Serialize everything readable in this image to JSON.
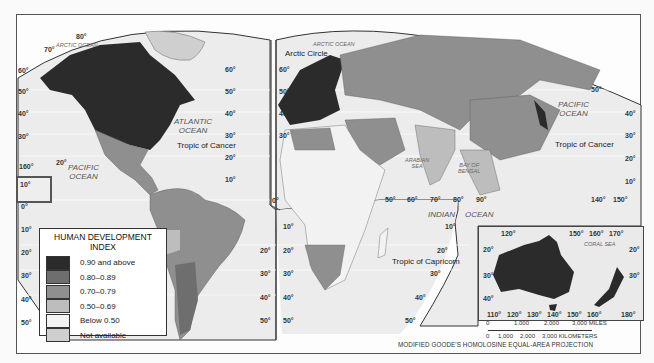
{
  "map": {
    "title": "Human Development Index World Map",
    "projection": "MODIFIED GOODE'S HOMOLOSINE EQUAL-AREA PROJECTION",
    "colors": {
      "background": "#fdfdfd",
      "ocean": "#e8e8e8",
      "hdi_090_above": "#2b2b2b",
      "hdi_080_089": "#6e6e6e",
      "hdi_070_079": "#8f8f8f",
      "hdi_050_069": "#bdbdbd",
      "hdi_below_050": "#f2f2f2",
      "not_available": "#cfcfcf"
    }
  },
  "legend": {
    "title_line1": "HUMAN DEVELOPMENT",
    "title_line2": "INDEX",
    "items": [
      {
        "label": "0.90 and above",
        "color": "#2b2b2b"
      },
      {
        "label": "0.80–0.89",
        "color": "#6e6e6e"
      },
      {
        "label": "0.70–0.79",
        "color": "#8f8f8f"
      },
      {
        "label": "0.50–0.69",
        "color": "#bdbdbd"
      },
      {
        "label": "Below 0.50",
        "color": "#f2f2f2"
      },
      {
        "label": "Not available",
        "color": "#cfcfcf"
      }
    ]
  },
  "labels": {
    "arctic_ocean_west": "ARCTIC OCEAN",
    "arctic_ocean_east": "ARCTIC OCEAN",
    "arctic_circle": "Arctic Circle",
    "atlantic_1": "ATLANTIC",
    "atlantic_2": "OCEAN",
    "pacific_west_1": "PACIFIC",
    "pacific_west_2": "OCEAN",
    "pacific_east_1": "PACIFIC",
    "pacific_east_2": "OCEAN",
    "tropic_cancer_west": "Tropic of Cancer",
    "tropic_cancer_east": "Tropic of Cancer",
    "tropic_capricorn": "Tropic of Capricorn",
    "arabian_sea_1": "ARABIAN",
    "arabian_sea_2": "SEA",
    "bay_bengal_1": "BAY OF",
    "bay_bengal_2": "BENGAL",
    "indian": "INDIAN",
    "ocean_indian": "OCEAN",
    "coral_sea": "CORAL SEA"
  },
  "graticule": {
    "west_lat": [
      "80°",
      "70°",
      "60°",
      "50°",
      "40°",
      "30°",
      "20°",
      "10°",
      "0°",
      "10°",
      "20°",
      "30°",
      "40°",
      "50°"
    ],
    "left_edge": [
      "60°",
      "50°",
      "40°",
      "30°",
      "0°",
      "10°",
      "20°",
      "30°",
      "40°",
      "50°"
    ],
    "hawaii": [
      "20°",
      "160°"
    ],
    "mid_left": [
      "60°",
      "50°",
      "40°",
      "30°",
      "20°",
      "10°"
    ],
    "mid_right": [
      "60°",
      "50°",
      "40°",
      "30°"
    ],
    "africa_left": [
      "0°",
      "10°",
      "20°",
      "30°",
      "40°",
      "50°"
    ],
    "sa_right": [
      "20°",
      "30°",
      "40°",
      "50°"
    ],
    "east_lon": [
      "50°",
      "60°",
      "70°",
      "80°",
      "90°"
    ],
    "east_right_lat": [
      "50°",
      "40°",
      "30°",
      "20°",
      "10°"
    ],
    "east_lon_right": [
      "140°",
      "150°"
    ],
    "indian_lat": [
      "10°",
      "20°",
      "30°",
      "40°",
      "50°"
    ],
    "aus_top": [
      "120°",
      "150°",
      "160°",
      "170°"
    ],
    "aus_left": [
      "20°",
      "30°",
      "40°"
    ],
    "aus_right": [
      "20°",
      "30°"
    ],
    "aus_bottom": [
      "110°",
      "120°",
      "130°",
      "140°",
      "150°",
      "160°",
      "180°"
    ]
  },
  "scale": {
    "miles": [
      "0",
      "1,000",
      "2,000",
      "3,000 MILES"
    ],
    "km": [
      "0",
      "1,000",
      "2,000",
      "3,000 KILOMETERS"
    ]
  }
}
